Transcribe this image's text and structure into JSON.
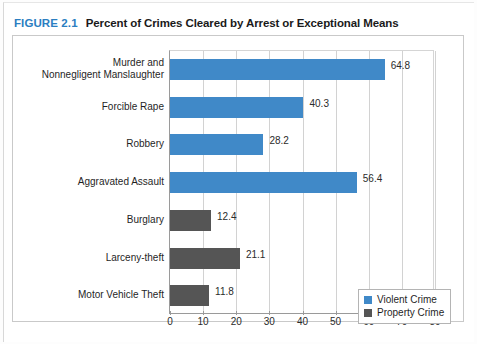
{
  "figure": {
    "number_label": "FIGURE 2.1",
    "title": "Percent of Crimes Cleared by Arrest or Exceptional Means",
    "number_color": "#2b7ec1",
    "title_color": "#1a1a1a"
  },
  "colors": {
    "violent": "#4089c8",
    "property": "#555555",
    "axis": "#9a9a9a",
    "grid": "#d2d2d2",
    "frame": "#c9c9c9"
  },
  "legend": {
    "position": "bottom-right",
    "items": [
      {
        "label": "Violent Crime",
        "color": "#4089c8"
      },
      {
        "label": "Property Crime",
        "color": "#555555"
      }
    ]
  },
  "axis": {
    "ticks": [
      "0",
      "10",
      "20",
      "30",
      "40",
      "50",
      "60",
      "70",
      "80"
    ],
    "min": 0,
    "max": 80,
    "step": 10
  },
  "source_note": "",
  "chart_data": {
    "type": "bar",
    "orientation": "horizontal",
    "title": "Percent of Crimes Cleared by Arrest or Exceptional Means",
    "xlabel": "",
    "ylabel": "",
    "xlim": [
      0,
      80
    ],
    "xticks": [
      0,
      10,
      20,
      30,
      40,
      50,
      60,
      70,
      80
    ],
    "grid": true,
    "legend_position": "bottom-right",
    "categories": [
      "Murder and\nNonnegligent Manslaughter",
      "Forcible Rape",
      "Robbery",
      "Aggravated Assault",
      "Burglary",
      "Larceny-theft",
      "Motor Vehicle Theft"
    ],
    "values": [
      64.8,
      40.3,
      28.2,
      56.4,
      12.4,
      21.1,
      11.8
    ],
    "groups": [
      "Violent Crime",
      "Violent Crime",
      "Violent Crime",
      "Violent Crime",
      "Property Crime",
      "Property Crime",
      "Property Crime"
    ],
    "series": [
      {
        "name": "Violent Crime",
        "color": "#4089c8",
        "points": [
          {
            "category": "Murder and Nonnegligent Manslaughter",
            "value": 64.8
          },
          {
            "category": "Forcible Rape",
            "value": 40.3
          },
          {
            "category": "Robbery",
            "value": 28.2
          },
          {
            "category": "Aggravated Assault",
            "value": 56.4
          }
        ]
      },
      {
        "name": "Property Crime",
        "color": "#555555",
        "points": [
          {
            "category": "Burglary",
            "value": 12.4
          },
          {
            "category": "Larceny-theft",
            "value": 21.1
          },
          {
            "category": "Motor Vehicle Theft",
            "value": 11.8
          }
        ]
      }
    ],
    "bars": [
      {
        "label_line1": "Murder and",
        "label_line2": "Nonnegligent Manslaughter",
        "value": 64.8,
        "value_label": "64.8",
        "group": "Violent Crime"
      },
      {
        "label_line1": "Forcible Rape",
        "label_line2": "",
        "value": 40.3,
        "value_label": "40.3",
        "group": "Violent Crime"
      },
      {
        "label_line1": "Robbery",
        "label_line2": "",
        "value": 28.2,
        "value_label": "28.2",
        "group": "Violent Crime"
      },
      {
        "label_line1": "Aggravated Assault",
        "label_line2": "",
        "value": 56.4,
        "value_label": "56.4",
        "group": "Violent Crime"
      },
      {
        "label_line1": "Burglary",
        "label_line2": "",
        "value": 12.4,
        "value_label": "12.4",
        "group": "Property Crime"
      },
      {
        "label_line1": "Larceny-theft",
        "label_line2": "",
        "value": 21.1,
        "value_label": "21.1",
        "group": "Property Crime"
      },
      {
        "label_line1": "Motor Vehicle Theft",
        "label_line2": "",
        "value": 11.8,
        "value_label": "11.8",
        "group": "Property Crime"
      }
    ]
  }
}
